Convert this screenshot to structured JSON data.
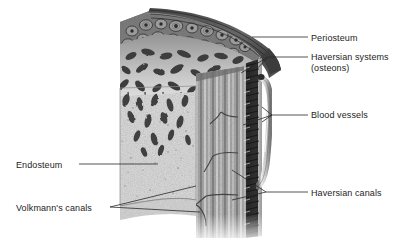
{
  "figure": {
    "style": "grayscale-pen-and-ink-illustration",
    "background_color": "#ffffff",
    "ink_color": "#1d1d1d",
    "leader_line_color": "#2a2a2a"
  },
  "labels": [
    {
      "id": "periosteum",
      "text": "Periosteum",
      "side": "right",
      "leader": "straight"
    },
    {
      "id": "haversian-systems",
      "text": "Haversian systems",
      "text_line2": "(osteons)",
      "side": "right",
      "leader": "forked"
    },
    {
      "id": "blood-vessels",
      "text": "Blood vessels",
      "side": "right",
      "leader": "forked-three"
    },
    {
      "id": "haversian-canals",
      "text": "Haversian canals",
      "side": "right",
      "leader": "forked"
    },
    {
      "id": "endosteum",
      "text": "Endosteum",
      "side": "left",
      "leader": "straight"
    },
    {
      "id": "volkmanns-canals",
      "text": "Volkmann's canals",
      "side": "left",
      "leader": "forked"
    }
  ],
  "regions": [
    {
      "id": "periosteum-band",
      "description": "dark layered membrane over outer surface"
    },
    {
      "id": "osteon-field",
      "description": "cut face showing circular osteon cross-sections"
    },
    {
      "id": "spongy-bone",
      "description": "trabecular spongy bone network"
    },
    {
      "id": "marrow-cavity",
      "description": "pale speckled inner cavity lined by endosteum"
    },
    {
      "id": "lamellae-column",
      "description": "vertical striated compact bone lamellae"
    },
    {
      "id": "bristle-edge",
      "description": "dark bristled outer compact bone margin"
    },
    {
      "id": "vessel-tube",
      "description": "pale tubular blood vessel along outer edge"
    }
  ]
}
